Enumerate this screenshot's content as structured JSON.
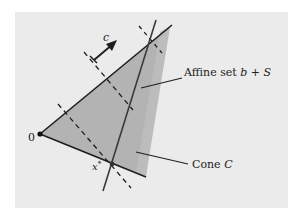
{
  "figure": {
    "colors": {
      "page_bg": "#ffffff",
      "panel_bg": "#ebebeb",
      "cone_fill": "#b3b3b3",
      "cone_fill_light": "#c4c4c4",
      "stroke": "#1e1e1e",
      "affine_stroke": "#555555"
    },
    "labels": {
      "origin": "0",
      "cost_vector": "c",
      "affine_set_text": "Affine set ",
      "affine_set_math": "b + S",
      "cone_text": "Cone ",
      "cone_math": "C",
      "optimum_base": "x",
      "optimum_sup": "*"
    },
    "points": {
      "origin": [
        40,
        134
      ],
      "optimum": [
        112,
        164
      ],
      "cone_upper_end": [
        172,
        25
      ],
      "cone_lower_end": [
        146,
        177
      ]
    }
  }
}
